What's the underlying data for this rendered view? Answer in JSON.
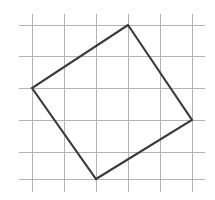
{
  "figure": {
    "background_color": "#ffffff",
    "canvas": {
      "width": 215,
      "height": 200
    }
  },
  "grid": {
    "name": "square-grid",
    "color": "#b4b4b4",
    "stroke_width": 1,
    "spacing": 32,
    "vertical_line_x": [
      32,
      64,
      96,
      128,
      160,
      192
    ],
    "horizontal_line_y": [
      25,
      56,
      88,
      120,
      152,
      179
    ],
    "vertical_extent": {
      "y_start": 14,
      "y_end": 192
    },
    "horizontal_extent": {
      "x_start": 19,
      "x_end": 205
    }
  },
  "shape": {
    "name": "tilted-square",
    "type": "quadrilateral",
    "stroke_color": "#3a3a3a",
    "stroke_width": 2.1,
    "fill": "none",
    "closed": true,
    "vertices": [
      {
        "label": "top",
        "x": 128,
        "y": 25
      },
      {
        "label": "right",
        "x": 192,
        "y": 120
      },
      {
        "label": "bottom",
        "x": 96,
        "y": 179
      },
      {
        "label": "left",
        "x": 32,
        "y": 88
      }
    ],
    "points_attr": "128,25 192,120 96,179 32,88"
  }
}
